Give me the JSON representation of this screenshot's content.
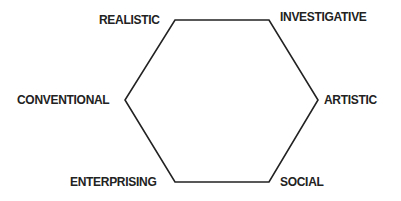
{
  "diagram": {
    "type": "hexagon",
    "title": "",
    "line_color": "#222222",
    "nodes": [
      {
        "id": "realistic",
        "label": "REALISTIC"
      },
      {
        "id": "investigative",
        "label": "INVESTIGATIVE"
      },
      {
        "id": "artistic",
        "label": "ARTISTIC"
      },
      {
        "id": "social",
        "label": "SOCIAL"
      },
      {
        "id": "enterprising",
        "label": "ENTERPRISING"
      },
      {
        "id": "conventional",
        "label": "CONVENTIONAL"
      }
    ],
    "edges": [
      [
        "realistic",
        "investigative"
      ],
      [
        "investigative",
        "artistic"
      ],
      [
        "artistic",
        "social"
      ],
      [
        "social",
        "enterprising"
      ],
      [
        "enterprising",
        "conventional"
      ],
      [
        "conventional",
        "realistic"
      ]
    ]
  }
}
